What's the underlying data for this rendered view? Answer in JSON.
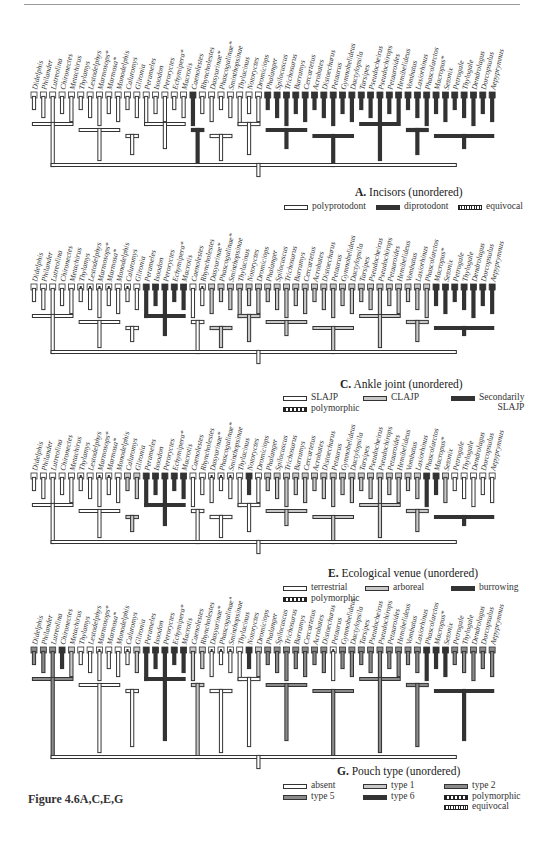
{
  "taxa": [
    "Didelphis",
    "Philander",
    "Lutreolina",
    "Chironectes",
    "Metachirus",
    "Thylamys",
    "Lestodelphys",
    "Marmosops*",
    "Marmosa*",
    "Monodelphis",
    "Caluromys",
    "Glironia",
    "Perameles",
    "Isoodon",
    "Peroryctes",
    "Echymipera*",
    "Macrotis",
    "Caenolestes",
    "Rhyncholestes",
    "Dasyurinae*",
    "Phascogalinae*",
    "Sminthopsinae",
    "Thylacinus",
    "Notoryctes",
    "Dromiciops",
    "Phalanger",
    "Spilocuscus",
    "Trichosurus",
    "Burramys",
    "Cercartetus",
    "Acrobates",
    "Distoechurus",
    "Petaurus",
    "Gymnobelideus",
    "Dactylopsila",
    "Tarsipes",
    "Pseudocheirus",
    "Pseudochirops",
    "Petauroides",
    "Hemibelideus",
    "Vombatus",
    "Lasiorhinus",
    "Phascolarctos",
    "Macropus*",
    "Setonix",
    "Petrogale",
    "Thylogale",
    "Dendrolagus",
    "Dorcopsulus",
    "Aepyprymnus"
  ],
  "state_colors": {
    "white": "#ffffff",
    "light": "#c8c8c8",
    "mid": "#8a8a8a",
    "dark": "#333333",
    "outline": "#333333"
  },
  "panels": [
    {
      "id": "A",
      "letter": "A.",
      "title": "Incisors (unordered)",
      "legend": [
        {
          "label": "polyprotodont",
          "style": "white"
        },
        {
          "label": "diprotodont",
          "style": "dark"
        },
        {
          "label": "equivocal",
          "style": "equiv"
        }
      ],
      "tip_states": "WWWWWWWWWWWWWWWWWDWWWWWWWDDDDDDDDDDDDDDDDDDDDDDDDD"
    },
    {
      "id": "C",
      "letter": "C.",
      "title": "Ankle joint (unordered)",
      "legend": [
        {
          "label": "SLAJP",
          "style": "white"
        },
        {
          "label": "CLAJP",
          "style": "light"
        },
        {
          "label": "Secondarily",
          "label2": "SLAJP",
          "style": "dark"
        },
        {
          "label": "polymorphic",
          "style": "poly"
        }
      ],
      "tip_states": "WWWWWPPPPWPWDDDDDWPLLLLLLLLLLLLLLLLLLLLLLLLDDDDDDD"
    },
    {
      "id": "E",
      "letter": "E.",
      "title": "Ecological venue (unordered)",
      "legend": [
        {
          "label": "terrestrial",
          "style": "white"
        },
        {
          "label": "arboreal",
          "style": "light"
        },
        {
          "label": "burrowing",
          "style": "dark"
        },
        {
          "label": "polymorphic",
          "style": "poly"
        }
      ],
      "tip_states": "WWWWWPWPPWLLDDDDDWWPPPWDWLLLLLLLLLLLLLLLLLDDLWWWWWW"
    },
    {
      "id": "G",
      "letter": "G.",
      "title": "Pouch type (unordered)",
      "legend": [
        {
          "label": "absent",
          "style": "white"
        },
        {
          "label": "type 1",
          "style": "light"
        },
        {
          "label": "type 2",
          "style": "mid"
        },
        {
          "label": "type 5",
          "style": "mid"
        },
        {
          "label": "type 6",
          "style": "dark"
        },
        {
          "label": "polymorphic",
          "style": "poly"
        },
        {
          "label": "equivocal",
          "style": "equiv"
        }
      ],
      "tip_states": "MMMDLWWPWWPLDDDDDLLPPPWDLMMMMMMMPMMMMMMMMMDDDMMMMMMM"
    }
  ],
  "caption": "Figure 4.6A,C,E,G"
}
